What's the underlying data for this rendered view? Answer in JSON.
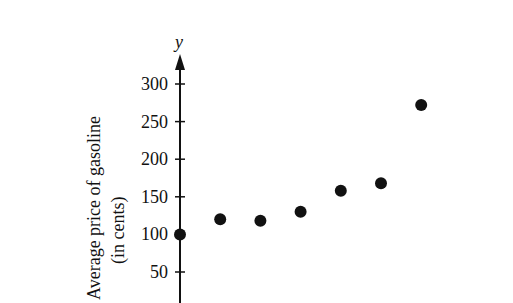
{
  "chart_data": {
    "type": "scatter",
    "title": "",
    "xlabel": "",
    "ylabel": "Average price of gasoline (in cents)",
    "ylabel_lines": [
      "Average price of gasoline",
      "(in cents)"
    ],
    "y_axis_letter": "y",
    "yticks": [
      50,
      100,
      150,
      200,
      250,
      300
    ],
    "ylim": [
      0,
      320
    ],
    "grid": false,
    "legend": null,
    "x": [
      0,
      1,
      2,
      3,
      4,
      5,
      6
    ],
    "values": [
      100,
      120,
      118,
      130,
      158,
      168,
      272
    ],
    "marker_color": "#111111"
  }
}
